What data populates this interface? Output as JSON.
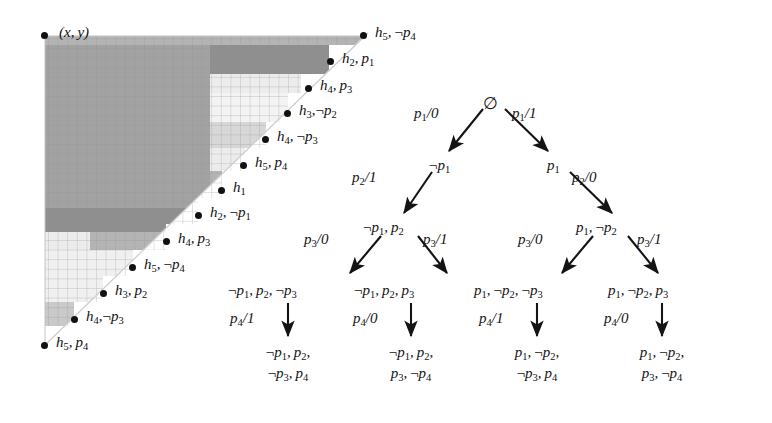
{
  "figure": {
    "caption_none": "",
    "grid": {
      "origin_label": "(x, y)",
      "cell_size_px": 9.6,
      "cols": 34,
      "rows": 32,
      "shades": {
        "darkest": "#8f8f8f",
        "dark": "#a2a2a2",
        "mid": "#b4b4b4",
        "light": "#d7d7d7",
        "lightest": "#ececec",
        "white": "#ffffff"
      },
      "gridline_color": "#9a9a9a",
      "hypotenuse_color": "#c9c9c9"
    },
    "staircase_points": [
      {
        "id": "p-origin",
        "label": "(x, y)",
        "x": 45,
        "y": 36,
        "label_dx": 12,
        "label_dy": -8,
        "is_origin": true
      },
      {
        "id": "pt-h5-np4-top",
        "label": "h5, ¬p4",
        "h": "5",
        "sign": "neg",
        "p": "4",
        "x": 364,
        "y": 36,
        "label_dx": 10,
        "label_dy": -8
      },
      {
        "id": "pt-h2-p1",
        "label": "h2, p1",
        "h": "2",
        "sign": "pos",
        "p": "1",
        "x": 329,
        "y": 62,
        "label_dx": 10,
        "label_dy": -8
      },
      {
        "id": "pt-h4-p3-top",
        "label": "h4, p3",
        "h": "4",
        "sign": "pos",
        "p": "3",
        "x": 307,
        "y": 88,
        "label_dx": 10,
        "label_dy": -8
      },
      {
        "id": "pt-h3-np2",
        "label": "h3, ¬p2",
        "h": "3",
        "sign": "neg",
        "p": "2",
        "x": 288,
        "y": 113,
        "label_dx": 10,
        "label_dy": -8
      },
      {
        "id": "pt-h4-np3-top",
        "label": "h4, ¬p3",
        "h": "4",
        "sign": "neg",
        "p": "3",
        "x": 265,
        "y": 139,
        "label_dx": 10,
        "label_dy": -8
      },
      {
        "id": "pt-h5-p4-top",
        "label": "h5, p4",
        "h": "5",
        "sign": "pos",
        "p": "4",
        "x": 244,
        "y": 165,
        "label_dx": 10,
        "label_dy": -8
      },
      {
        "id": "pt-h1",
        "label": "h1",
        "h": "1",
        "sign": "none",
        "p": "",
        "x": 221,
        "y": 190,
        "label_dx": 10,
        "label_dy": -8
      },
      {
        "id": "pt-h2-np1",
        "label": "h2, ¬p1",
        "h": "2",
        "sign": "neg",
        "p": "1",
        "x": 198,
        "y": 215,
        "label_dx": 10,
        "label_dy": -8
      },
      {
        "id": "pt-h4-p3-bot",
        "label": "h4, p3",
        "h": "4",
        "sign": "pos",
        "p": "3",
        "x": 166,
        "y": 241,
        "label_dx": 10,
        "label_dy": -8
      },
      {
        "id": "pt-h5-np4-bot",
        "label": "h5, ¬p4",
        "h": "5",
        "sign": "neg",
        "p": "4",
        "x": 132,
        "y": 267,
        "label_dx": 10,
        "label_dy": -8
      },
      {
        "id": "pt-h3-p2",
        "label": "h3, p2",
        "h": "3",
        "sign": "pos",
        "p": "2",
        "x": 103,
        "y": 293,
        "label_dx": 10,
        "label_dy": -8
      },
      {
        "id": "pt-h4-np3-bot",
        "label": "h4, ¬p3",
        "h": "4",
        "sign": "neg",
        "p": "3",
        "x": 74,
        "y": 319,
        "label_dx": 10,
        "label_dy": -8
      },
      {
        "id": "pt-h5-p4-bot",
        "label": "h5, p4",
        "h": "5",
        "sign": "pos",
        "p": "4",
        "x": 45,
        "y": 345,
        "label_dx": 10,
        "label_dy": -8
      }
    ],
    "tree": {
      "root": {
        "id": "node-root",
        "text": "∅",
        "x": 490,
        "y": 105
      },
      "nodes": [
        {
          "id": "node-not-p1",
          "text": "¬p1",
          "x": 441,
          "y": 166
        },
        {
          "id": "node-p1",
          "text": "p1",
          "x": 554,
          "y": 166
        },
        {
          "id": "node-not-p1-p2",
          "text": "¬p1, p2",
          "x": 395,
          "y": 228
        },
        {
          "id": "node-p1-not-p2",
          "text": "p1, ¬p2",
          "x": 607,
          "y": 228
        },
        {
          "id": "node-l1",
          "text": "¬p1, p2, ¬p3",
          "x": 276,
          "y": 290
        },
        {
          "id": "node-l2",
          "text": "¬p1, p2, p3",
          "x": 398,
          "y": 290
        },
        {
          "id": "node-l3",
          "text": "p1, ¬p2, ¬p3",
          "x": 525,
          "y": 290
        },
        {
          "id": "node-l4",
          "text": "p1, ¬p2, p3",
          "x": 650,
          "y": 290
        }
      ],
      "leaves": [
        {
          "id": "leaf-1",
          "line1": "¬p1, p2,",
          "line2": "¬p3, p4",
          "x": 276,
          "y": 352
        },
        {
          "id": "leaf-2",
          "line1": "¬p1, p2,",
          "line2": "p3, ¬p4",
          "x": 398,
          "y": 352
        },
        {
          "id": "leaf-3",
          "line1": "p1, ¬p2,",
          "line2": "¬p3, p4",
          "x": 525,
          "y": 352
        },
        {
          "id": "leaf-4",
          "line1": "p1, ¬p2,",
          "line2": "p3, ¬p4",
          "x": 650,
          "y": 352
        }
      ],
      "edge_labels": [
        {
          "id": "edge-p1-0",
          "text": "p1/0",
          "x": 440,
          "y": 114
        },
        {
          "id": "edge-p1-1",
          "text": "p1/1",
          "x": 533,
          "y": 114
        },
        {
          "id": "edge-p2-1",
          "text": "p2/1",
          "x": 378,
          "y": 178
        },
        {
          "id": "edge-p2-0",
          "text": "p2/0",
          "x": 594,
          "y": 178
        },
        {
          "id": "edge-p3-0-left",
          "text": "p3/0",
          "x": 330,
          "y": 240
        },
        {
          "id": "edge-p3-1-left",
          "text": "p3/1",
          "x": 444,
          "y": 240
        },
        {
          "id": "edge-p3-0-right",
          "text": "p3/0",
          "x": 545,
          "y": 240
        },
        {
          "id": "edge-p3-1-right",
          "text": "p3/1",
          "x": 658,
          "y": 240
        },
        {
          "id": "edge-p4-1-a",
          "text": "p4/1",
          "x": 252,
          "y": 318
        },
        {
          "id": "edge-p4-0-a",
          "text": "p4/0",
          "x": 374,
          "y": 318
        },
        {
          "id": "edge-p4-1-b",
          "text": "p4/1",
          "x": 500,
          "y": 318
        },
        {
          "id": "edge-p4-0-b",
          "text": "p4/0",
          "x": 625,
          "y": 318
        }
      ]
    }
  }
}
